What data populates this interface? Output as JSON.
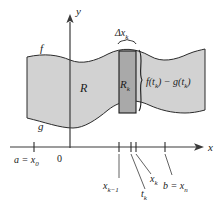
{
  "figure": {
    "axes": {
      "y_axis_label": "y",
      "x_axis_label": "x",
      "origin_label": "0"
    },
    "curves": {
      "upper_label": "f",
      "lower_label": "g"
    },
    "regions": {
      "region_label": "R",
      "rectangle_label": "R",
      "rectangle_sub": "k"
    },
    "annotations": {
      "width_delta": "Δx",
      "width_delta_sub": "k",
      "height_expr_f": "f(t",
      "height_expr_f_sub": "k",
      "height_expr_mid": ") − g(t",
      "height_expr_end": ")"
    },
    "ticks": [
      {
        "name": "a-x0",
        "x": 34,
        "label_main": "a = x",
        "label_sub": "0"
      },
      {
        "name": "xk-minus-1",
        "x": 119,
        "label_main": "x",
        "label_sub": "k−1"
      },
      {
        "name": "tk",
        "x": 132,
        "label_main": "t",
        "label_sub": "k"
      },
      {
        "name": "xk",
        "x": 136,
        "label_main": "x",
        "label_sub": "k"
      },
      {
        "name": "b-xn",
        "x": 165,
        "label_main": "b = x",
        "label_sub": "n"
      }
    ],
    "colors": {
      "region_fill": "#d2d2d2",
      "rect_fill": "#a9a9a9",
      "stroke": "#2b2b2b",
      "text": "#1a1a1a",
      "background": "#ffffff"
    }
  }
}
